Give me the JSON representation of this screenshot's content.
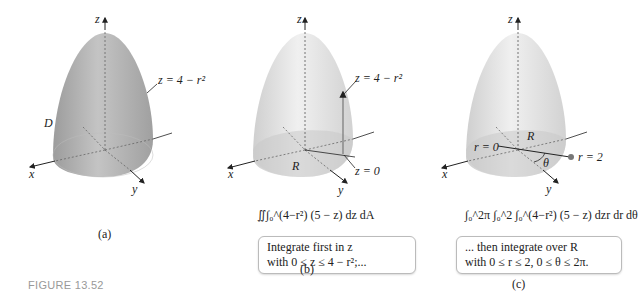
{
  "figure_number": "FIGURE 13.52",
  "panels": [
    {
      "caption": "(a)",
      "axes": {
        "x": "x",
        "y": "y",
        "z": "z"
      },
      "labels": {
        "surface": "z = 4 − r²",
        "region": "D"
      }
    },
    {
      "caption": "(b)",
      "axes": {
        "x": "x",
        "y": "y",
        "z": "z"
      },
      "labels": {
        "surface": "z = 4 − r²",
        "base": "z = 0",
        "region": "R"
      },
      "formula": "∬∫₀^(4−r²) (5 − z) dz dA",
      "note_line1": "Integrate first in z",
      "note_line2": "with 0 ≤ z ≤ 4 − r²;..."
    },
    {
      "caption": "(c)",
      "axes": {
        "x": "x",
        "y": "y",
        "z": "z"
      },
      "labels": {
        "r0": "r = 0",
        "r2": "r = 2",
        "region": "R",
        "angle": "θ"
      },
      "formula": "∫₀^2π ∫₀^2 ∫₀^(4−r²) (5 − z) dzr dr dθ",
      "note_line1": "... then integrate over R",
      "note_line2": "with 0 ≤ r ≤ 2, 0 ≤ θ ≤ 2π."
    }
  ],
  "colors": {
    "surface_a": "#a9a9a9",
    "surface_light": "#dcdcdc",
    "point": "#777777",
    "figure_label": "#999999"
  }
}
